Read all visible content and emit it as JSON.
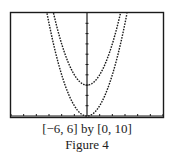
{
  "chart_data": {
    "type": "line",
    "title": "Figure 4",
    "window_label": "[−6, 6] by [0, 10]",
    "xlabel": "",
    "ylabel": "",
    "xlim": [
      -6,
      6
    ],
    "ylim": [
      0,
      10
    ],
    "x_tick_step": 1,
    "y_tick_step": 1,
    "grid": false,
    "legend": null,
    "series": [
      {
        "name": "y = x^2 + 3",
        "style": "dotted",
        "expr": "x^2+3",
        "x": [
          -2.65,
          -2,
          -1,
          0,
          1,
          2,
          2.65
        ],
        "values": [
          10,
          7,
          4,
          3,
          4,
          7,
          10
        ]
      },
      {
        "name": "y = x^2",
        "style": "dotted",
        "expr": "x^2",
        "x": [
          -3.16,
          -3,
          -2,
          -1,
          0,
          1,
          2,
          3,
          3.16
        ],
        "values": [
          10,
          9,
          4,
          1,
          0,
          1,
          4,
          9,
          10
        ]
      }
    ]
  },
  "caption": {
    "window": "[−6, 6] by [0, 10]",
    "figure": "Figure 4"
  },
  "colors": {
    "frame": "#1a1a1a",
    "curve": "#1a1a1a",
    "background": "#ffffff"
  }
}
